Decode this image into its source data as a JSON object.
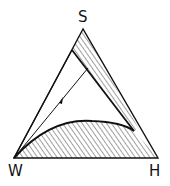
{
  "diagram": {
    "type": "ternary-phase-diagram",
    "vertices": {
      "top": "S",
      "bottom_left": "W",
      "bottom_right": "H"
    },
    "regions": [
      {
        "name": "upper-hatched-band",
        "hatched": true
      },
      {
        "name": "lower-hatched-region",
        "hatched": true
      },
      {
        "name": "central-clear-region",
        "hatched": false
      }
    ],
    "colors": {
      "line": "#111111",
      "background": "#ffffff"
    }
  }
}
